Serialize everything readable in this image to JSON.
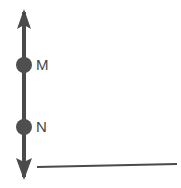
{
  "figure": {
    "background_color": "#ffffff",
    "stroke_color": "#4a4a4a",
    "marker_fill_color": "#4f4f4f",
    "label_color": "#454545",
    "width": 181,
    "height": 188
  },
  "vertical_axis": {
    "name": "vertical-axis",
    "x": 24,
    "top_y": 9,
    "bottom_y": 180,
    "line_width": 4,
    "arrowhead_top": {
      "half_width": 7,
      "height": 20,
      "tip_y": 9
    },
    "arrowhead_bottom": {
      "half_width": 8,
      "height": 22,
      "tip_y": 180
    }
  },
  "points": [
    {
      "id": "point-m",
      "label": "M",
      "cx": 24,
      "cy": 65,
      "r": 8,
      "label_x": 36,
      "label_y": 66
    },
    {
      "id": "point-n",
      "label": "N",
      "cx": 24,
      "cy": 127,
      "r": 8,
      "label_x": 36,
      "label_y": 128
    }
  ],
  "reference_line": {
    "name": "horizontal-reference-line",
    "x1": 37,
    "y1": 167,
    "x2": 177,
    "y2": 164,
    "line_width": 2
  }
}
